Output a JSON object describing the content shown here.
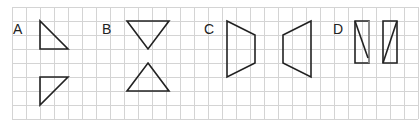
{
  "figure": {
    "grid": {
      "x0": 12,
      "y0": 7,
      "cell": 14,
      "cols": 29,
      "rows": 8,
      "color": "#d4d4d4"
    },
    "stroke_color": "#222222",
    "panels": [
      {
        "label": "A",
        "label_pos": [
          13,
          34
        ],
        "shapes": [
          {
            "name": "triangle-a-top",
            "points": "40,21 40,49 68,49"
          },
          {
            "name": "triangle-a-bottom",
            "points": "40,77 68,77 40,105"
          }
        ]
      },
      {
        "label": "B",
        "label_pos": [
          102,
          34
        ],
        "shapes": [
          {
            "name": "triangle-b-top",
            "points": "127,21 169,21 148,49"
          },
          {
            "name": "triangle-b-bottom",
            "points": "148,63 169,91 127,91"
          }
        ]
      },
      {
        "label": "C",
        "label_pos": [
          204,
          34
        ],
        "shapes": [
          {
            "name": "trapezoid-c-left",
            "points": "227,21 255,35 255,63 227,77"
          },
          {
            "name": "trapezoid-c-right",
            "points": "311,21 283,35 283,63 311,77"
          }
        ]
      },
      {
        "label": "D",
        "label_pos": [
          333,
          34
        ],
        "shapes": [
          {
            "name": "rectangle-d-left",
            "points": "355,21 369,21 369,63 355,63"
          },
          {
            "name": "rectangle-d-right",
            "points": "383,21 397,21 397,63 383,63"
          }
        ]
      }
    ]
  }
}
